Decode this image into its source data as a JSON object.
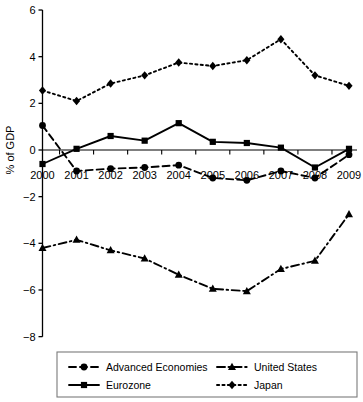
{
  "chart_data": {
    "type": "line",
    "title": "",
    "subtitle": "",
    "xlabel": "",
    "ylabel": "% of GDP",
    "x": [
      2000,
      2001,
      2002,
      2003,
      2004,
      2005,
      2006,
      2007,
      2008,
      2009
    ],
    "categories": [
      "2000",
      "2001",
      "2002",
      "2003",
      "2004",
      "2005",
      "2006",
      "2007",
      "2008",
      "2009"
    ],
    "xlim": [
      1999.6,
      2009.4
    ],
    "ylim": [
      -8,
      6
    ],
    "yticks": [
      6,
      4,
      2,
      0,
      -2,
      -4,
      -6,
      -8
    ],
    "yticklabels": [
      "6",
      "4",
      "2",
      "0",
      "−2",
      "−4",
      "−6",
      "−8"
    ],
    "grid": false,
    "legend_position": "bottom",
    "zero_line": true,
    "series": [
      {
        "name": "Advanced Economies",
        "marker": "circle",
        "dash": "dashed",
        "color": "#000000",
        "values": [
          1.05,
          -0.9,
          -0.8,
          -0.75,
          -0.65,
          -1.2,
          -1.3,
          -0.9,
          -1.2,
          -0.2
        ]
      },
      {
        "name": "Eurozone",
        "marker": "square",
        "dash": "solid",
        "color": "#000000",
        "values": [
          -0.6,
          0.05,
          0.6,
          0.4,
          1.15,
          0.35,
          0.3,
          0.1,
          -0.75,
          0.05
        ]
      },
      {
        "name": "United States",
        "marker": "triangle",
        "dash": "dashdot",
        "color": "#000000",
        "values": [
          -4.2,
          -3.85,
          -4.3,
          -4.65,
          -5.35,
          -5.95,
          -6.05,
          -5.1,
          -4.75,
          -2.75
        ]
      },
      {
        "name": "Japan",
        "marker": "diamond",
        "dash": "dotted",
        "color": "#000000",
        "values": [
          2.55,
          2.1,
          2.85,
          3.2,
          3.75,
          3.6,
          3.85,
          4.75,
          3.2,
          2.75
        ]
      }
    ]
  },
  "legend": {
    "entries": [
      {
        "label": "Advanced Economies",
        "marker": "circle",
        "dash": "dashed"
      },
      {
        "label": "Eurozone",
        "marker": "square",
        "dash": "solid"
      },
      {
        "label": "United States",
        "marker": "triangle",
        "dash": "dashdot"
      },
      {
        "label": "Japan",
        "marker": "diamond",
        "dash": "dotted"
      }
    ]
  },
  "colors": {
    "ink": "#000000",
    "background": "#ffffff",
    "legend_border": "#7a7a7a"
  }
}
